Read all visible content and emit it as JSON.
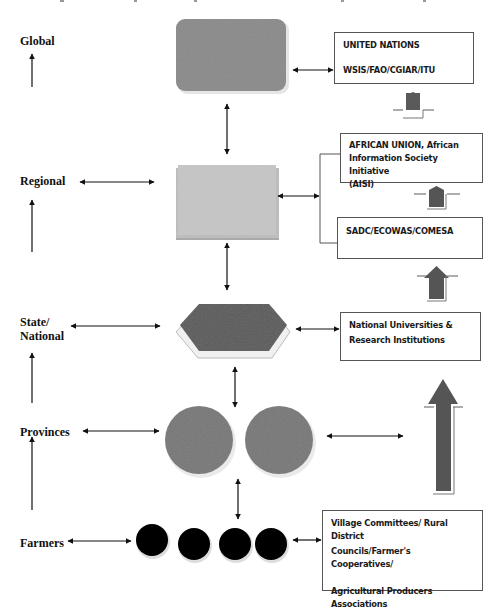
{
  "levels": {
    "global": "Global",
    "regional": "Regional",
    "state_national_line1": "State/",
    "state_national_line2": "National",
    "provinces": "Provinces",
    "farmers": "Farmers"
  },
  "boxes": {
    "un": {
      "line1": "UNITED NATIONS",
      "line2": "WSIS/FAO/CGIAR/ITU"
    },
    "au": {
      "line1": "AFRICAN UNION, African",
      "line2": "Information Society Initiative",
      "line3": "(AISI)"
    },
    "sadc": {
      "line1": "SADC/ECOWAS/COMESA"
    },
    "national": {
      "line1": "National Universities &",
      "line2": "Research Institutions"
    },
    "village": {
      "line1": "Village Committees/ Rural District",
      "line2": "Councils/Farmer's Cooperatives/",
      "line3": "Agricultural Producers Associations"
    }
  },
  "shapes": {
    "global": "rounded-rectangle",
    "regional": "rectangle",
    "state_national": "hexagon",
    "provinces": "two-circles",
    "farmers": "four-black-circles"
  },
  "colors": {
    "global_fill": "#8a8a8a",
    "regional_fill": "#c4c4c4",
    "hexagon_fill": "#5a5a5a",
    "province_fill": "#777777",
    "farmer_fill": "#000000",
    "arrow_fill": "#555555"
  }
}
